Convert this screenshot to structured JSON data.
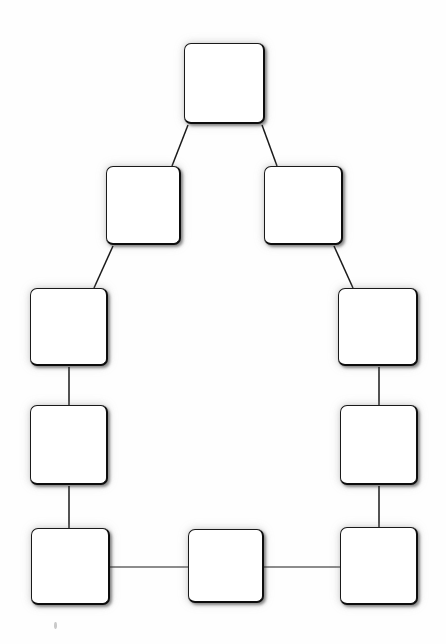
{
  "diagram": {
    "background_color": "#ffffff",
    "node_fill_color": "#ffffff",
    "node_border_color": "#1a1a1a",
    "edge_color": "#1a1a1a",
    "node_shape": "rounded-square",
    "nodes": [
      {
        "id": "node-top",
        "label": "",
        "x": 184,
        "y": 43,
        "w": 81,
        "h": 81
      },
      {
        "id": "node-row2-left",
        "label": "",
        "x": 106,
        "y": 166,
        "w": 75,
        "h": 79
      },
      {
        "id": "node-row2-right",
        "label": "",
        "x": 264,
        "y": 166,
        "w": 79,
        "h": 79
      },
      {
        "id": "node-row3-left",
        "label": "",
        "x": 30,
        "y": 288,
        "w": 78,
        "h": 78
      },
      {
        "id": "node-row3-right",
        "label": "",
        "x": 338,
        "y": 288,
        "w": 80,
        "h": 78
      },
      {
        "id": "node-row4-left",
        "label": "",
        "x": 30,
        "y": 405,
        "w": 78,
        "h": 80
      },
      {
        "id": "node-row4-right",
        "label": "",
        "x": 340,
        "y": 405,
        "w": 78,
        "h": 80
      },
      {
        "id": "node-bottom-left",
        "label": "",
        "x": 31,
        "y": 528,
        "w": 79,
        "h": 77
      },
      {
        "id": "node-bottom-middle",
        "label": "",
        "x": 188,
        "y": 529,
        "w": 76,
        "h": 74
      },
      {
        "id": "node-bottom-right",
        "label": "",
        "x": 340,
        "y": 527,
        "w": 78,
        "h": 78
      }
    ],
    "edges": [
      {
        "id": "edge-top-to-row2-left",
        "from": "node-top",
        "to": "node-row2-left",
        "type": "diagonal",
        "x1": 188,
        "y1": 125,
        "x2": 172,
        "y2": 166
      },
      {
        "id": "edge-top-to-row2-right",
        "from": "node-top",
        "to": "node-row2-right",
        "type": "diagonal",
        "x1": 262,
        "y1": 125,
        "x2": 277,
        "y2": 166
      },
      {
        "id": "edge-row2-left-to-row3-left",
        "from": "node-row2-left",
        "to": "node-row3-left",
        "type": "diagonal",
        "x1": 113,
        "y1": 246,
        "x2": 94,
        "y2": 288
      },
      {
        "id": "edge-row2-right-to-row3-right",
        "from": "node-row2-right",
        "to": "node-row3-right",
        "type": "diagonal",
        "x1": 334,
        "y1": 246,
        "x2": 353,
        "y2": 288
      },
      {
        "id": "edge-row3-left-to-row4-left",
        "from": "node-row3-left",
        "to": "node-row4-left",
        "type": "vertical",
        "x1": 69,
        "y1": 367,
        "x2": 69,
        "y2": 405
      },
      {
        "id": "edge-row3-right-to-row4-right",
        "from": "node-row3-right",
        "to": "node-row4-right",
        "type": "vertical",
        "x1": 379,
        "y1": 367,
        "x2": 379,
        "y2": 405
      },
      {
        "id": "edge-row4-left-to-bottom-left",
        "from": "node-row4-left",
        "to": "node-bottom-left",
        "type": "vertical",
        "x1": 69,
        "y1": 486,
        "x2": 69,
        "y2": 528
      },
      {
        "id": "edge-row4-right-to-bottom-right",
        "from": "node-row4-right",
        "to": "node-bottom-right",
        "type": "vertical",
        "x1": 379,
        "y1": 486,
        "x2": 379,
        "y2": 527
      },
      {
        "id": "edge-bottom-left-to-middle",
        "from": "node-bottom-left",
        "to": "node-bottom-middle",
        "type": "horizontal",
        "x1": 110,
        "y1": 567,
        "x2": 188,
        "y2": 567
      },
      {
        "id": "edge-bottom-middle-to-right",
        "from": "node-bottom-middle",
        "to": "node-bottom-right",
        "type": "horizontal",
        "x1": 264,
        "y1": 567,
        "x2": 340,
        "y2": 567
      }
    ],
    "artifacts": [
      {
        "id": "speck-bottom-left",
        "x": 54,
        "y": 622,
        "w": 3,
        "h": 7
      }
    ]
  }
}
